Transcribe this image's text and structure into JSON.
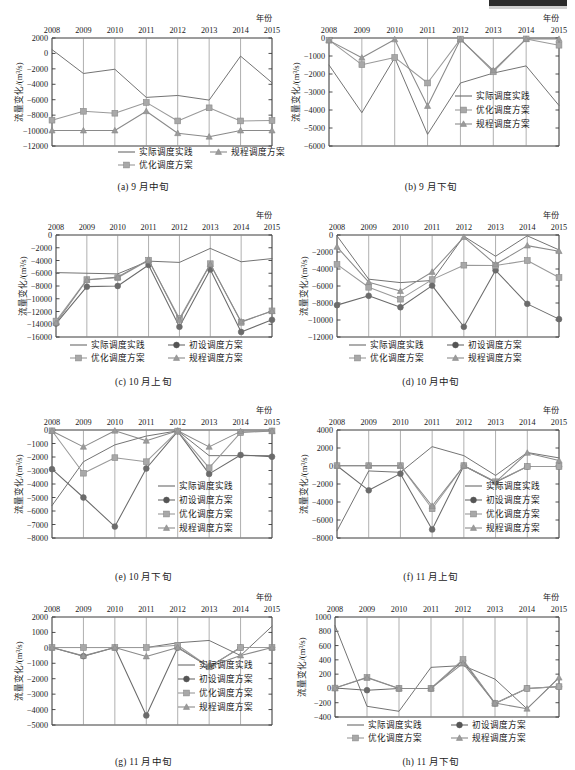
{
  "figure": {
    "year_axis_label": "年份",
    "y_axis_label": "流量变化/(m³/s)",
    "years": [
      "2008",
      "2009",
      "2010",
      "2011",
      "2012",
      "2013",
      "2014",
      "2015"
    ],
    "series_labels": {
      "actual": "实际调度实践",
      "initial": "初设调度方案",
      "optimized": "优化调度方案",
      "regulation": "规程调度方案"
    },
    "colors": {
      "actual": "#6b6b6b",
      "initial": "#555555",
      "optimized": "#9a9a9a",
      "regulation": "#8a8a8a",
      "axis": "#3a3a3a",
      "grid": "#8c8c8c"
    }
  },
  "chart_data": [
    {
      "id": "a",
      "type": "line",
      "title": "(a) 9 月中旬",
      "xlabel": "年份",
      "ylabel": "流量变化/(m³/s)",
      "categories": [
        "2008",
        "2009",
        "2010",
        "2011",
        "2012",
        "2013",
        "2014",
        "2015"
      ],
      "ylim": [
        -12000,
        2000
      ],
      "yticks": [
        2000,
        0,
        -2000,
        -4000,
        -6000,
        -8000,
        -10000,
        -12000
      ],
      "grid": true,
      "legend_position": "inside-bottom",
      "series": [
        {
          "name": "实际调度实践",
          "key": "actual",
          "marker": "none",
          "values": [
            500,
            -2600,
            -2050,
            -5700,
            -5450,
            -6050,
            -350,
            -3800
          ]
        },
        {
          "name": "优化调度方案",
          "key": "optimized",
          "marker": "square",
          "values": [
            -8650,
            -7500,
            -7750,
            -6350,
            -8750,
            -7050,
            -8750,
            -8700
          ]
        },
        {
          "name": "规程调度方案",
          "key": "regulation",
          "marker": "triangle",
          "values": [
            -10000,
            -10000,
            -10000,
            -7500,
            -10350,
            -10800,
            -10000,
            -10000
          ]
        }
      ]
    },
    {
      "id": "b",
      "type": "line",
      "title": "(b) 9 月下旬",
      "xlabel": "年份",
      "ylabel": "流量变化/(m³/s)",
      "categories": [
        "2008",
        "2009",
        "2010",
        "2011",
        "2012",
        "2013",
        "2014",
        "2015"
      ],
      "ylim": [
        -6000,
        0
      ],
      "yticks": [
        0,
        -1000,
        -2000,
        -3000,
        -4000,
        -5000,
        -6000
      ],
      "grid": true,
      "legend_position": "inside-right",
      "series": [
        {
          "name": "实际调度实践",
          "key": "actual",
          "marker": "none",
          "values": [
            -1500,
            -4150,
            -1100,
            -5350,
            -2500,
            -1950,
            -1550,
            -3750
          ]
        },
        {
          "name": "优化调度方案",
          "key": "optimized",
          "marker": "square",
          "values": [
            -120,
            -1480,
            -1080,
            -2500,
            -60,
            -1880,
            -50,
            -400
          ]
        },
        {
          "name": "规程调度方案",
          "key": "regulation",
          "marker": "triangle",
          "values": [
            -130,
            -1100,
            -80,
            -3780,
            -80,
            -1800,
            -60,
            -60
          ]
        }
      ]
    },
    {
      "id": "c",
      "type": "line",
      "title": "(c) 10 月上旬",
      "xlabel": "年份",
      "ylabel": "流量变化/(m³/s)",
      "categories": [
        "2008",
        "2009",
        "2010",
        "2011",
        "2012",
        "2013",
        "2014",
        "2015"
      ],
      "ylim": [
        -16000,
        0
      ],
      "yticks": [
        0,
        -2000,
        -4000,
        -6000,
        -8000,
        -10000,
        -12000,
        -14000,
        -16000
      ],
      "grid": true,
      "legend_position": "below-inside",
      "series": [
        {
          "name": "实际调度实践",
          "key": "actual",
          "marker": "none",
          "values": [
            -5900,
            -6000,
            -6100,
            -4100,
            -4300,
            -2100,
            -4200,
            -3700
          ]
        },
        {
          "name": "初设调度方案",
          "key": "initial",
          "marker": "circle",
          "values": [
            -13900,
            -8100,
            -8000,
            -4700,
            -14400,
            -5400,
            -15200,
            -13300
          ]
        },
        {
          "name": "优化调度方案",
          "key": "optimized",
          "marker": "square",
          "values": [
            -13500,
            -7000,
            -6700,
            -3950,
            -13100,
            -4500,
            -13700,
            -11900
          ]
        },
        {
          "name": "规程调度方案",
          "key": "regulation",
          "marker": "triangle",
          "values": [
            -13800,
            -7050,
            -6600,
            -3900,
            -13350,
            -4600,
            -13600,
            -11950
          ]
        }
      ]
    },
    {
      "id": "d",
      "type": "line",
      "title": "(d) 10 月中旬",
      "xlabel": "年份",
      "ylabel": "流量变化/(m³/s)",
      "categories": [
        "2008",
        "2009",
        "2010",
        "2011",
        "2012",
        "2013",
        "2014",
        "2015"
      ],
      "ylim": [
        -12000,
        0
      ],
      "yticks": [
        0,
        -2000,
        -4000,
        -6000,
        -8000,
        -10000,
        -12000
      ],
      "grid": true,
      "legend_position": "below-inside",
      "series": [
        {
          "name": "实际调度实践",
          "key": "actual",
          "marker": "none",
          "values": [
            -100,
            -5200,
            -5600,
            -5350,
            -150,
            -2500,
            -100,
            -1750
          ]
        },
        {
          "name": "初设调度方案",
          "key": "initial",
          "marker": "circle",
          "values": [
            -8250,
            -7150,
            -8500,
            -5950,
            -10800,
            -4150,
            -8100,
            -9900
          ]
        },
        {
          "name": "优化调度方案",
          "key": "optimized",
          "marker": "square",
          "values": [
            -3450,
            -6150,
            -7550,
            -5250,
            -3550,
            -3600,
            -3000,
            -5000
          ]
        },
        {
          "name": "规程调度方案",
          "key": "regulation",
          "marker": "triangle",
          "values": [
            -1400,
            -5550,
            -6600,
            -4350,
            -250,
            -3450,
            -1250,
            -1900
          ]
        }
      ]
    },
    {
      "id": "e",
      "type": "line",
      "title": "(e) 10 月下旬",
      "xlabel": "年份",
      "ylabel": "流量变化/(m³/s)",
      "categories": [
        "2008",
        "2009",
        "2010",
        "2011",
        "2012",
        "2013",
        "2014",
        "2015"
      ],
      "ylim": [
        -8000,
        0
      ],
      "yticks": [
        0,
        -1000,
        -2000,
        -3000,
        -4000,
        -5000,
        -6000,
        -7000,
        -8000
      ],
      "grid": true,
      "legend_position": "inside-right",
      "series": [
        {
          "name": "实际调度实践",
          "key": "actual",
          "marker": "none",
          "values": [
            -5600,
            -2350,
            -1100,
            -450,
            -60,
            -1900,
            -1900,
            -1900
          ]
        },
        {
          "name": "初设调度方案",
          "key": "initial",
          "marker": "circle",
          "values": [
            -2900,
            -5000,
            -7150,
            -2850,
            -100,
            -3250,
            -1850,
            -1980
          ]
        },
        {
          "name": "优化调度方案",
          "key": "optimized",
          "marker": "square",
          "values": [
            -60,
            -3200,
            -2050,
            -2350,
            -80,
            -2800,
            -200,
            -70
          ]
        },
        {
          "name": "规程调度方案",
          "key": "regulation",
          "marker": "triangle",
          "values": [
            -70,
            -1250,
            -60,
            -800,
            -60,
            -1250,
            -100,
            -70
          ]
        }
      ]
    },
    {
      "id": "f",
      "type": "line",
      "title": "(f) 11 月上旬",
      "xlabel": "年份",
      "ylabel": "流量变化/(m³/s)",
      "categories": [
        "2008",
        "2009",
        "2010",
        "2011",
        "2012",
        "2013",
        "2014",
        "2015"
      ],
      "ylim": [
        -8000,
        4000
      ],
      "yticks": [
        4000,
        2000,
        0,
        -2000,
        -4000,
        -6000,
        -8000
      ],
      "grid": true,
      "legend_position": "inside-right",
      "series": [
        {
          "name": "实际调度实践",
          "key": "actual",
          "marker": "none",
          "values": [
            -7200,
            -550,
            -700,
            2150,
            1150,
            -1050,
            1500,
            900
          ]
        },
        {
          "name": "初设调度方案",
          "key": "initial",
          "marker": "circle",
          "values": [
            30,
            -2700,
            -850,
            -7050,
            30,
            -1800,
            -60,
            -60
          ]
        },
        {
          "name": "优化调度方案",
          "key": "optimized",
          "marker": "square",
          "values": [
            40,
            40,
            40,
            -4750,
            40,
            -1750,
            -50,
            -50
          ]
        },
        {
          "name": "规程调度方案",
          "key": "regulation",
          "marker": "triangle",
          "values": [
            30,
            30,
            30,
            -4450,
            30,
            -1800,
            1450,
            600
          ]
        }
      ]
    },
    {
      "id": "g",
      "type": "line",
      "title": "(g) 11 月中旬",
      "xlabel": "年份",
      "ylabel": "流量变化/(m³/s)",
      "categories": [
        "2008",
        "2009",
        "2010",
        "2011",
        "2012",
        "2013",
        "2014",
        "2015"
      ],
      "ylim": [
        -5000,
        2000
      ],
      "yticks": [
        2000,
        1000,
        0,
        -1000,
        -2000,
        -3000,
        -4000,
        -5000
      ],
      "grid": true,
      "legend_position": "inside-right",
      "series": [
        {
          "name": "实际调度实践",
          "key": "actual",
          "marker": "none",
          "values": [
            20,
            20,
            20,
            20,
            330,
            480,
            -500,
            1400
          ]
        },
        {
          "name": "初设调度方案",
          "key": "initial",
          "marker": "circle",
          "values": [
            20,
            -540,
            20,
            -4380,
            20,
            -1230,
            20,
            20
          ]
        },
        {
          "name": "优化调度方案",
          "key": "optimized",
          "marker": "square",
          "values": [
            20,
            20,
            20,
            20,
            170,
            -1230,
            20,
            20
          ]
        },
        {
          "name": "规程调度方案",
          "key": "regulation",
          "marker": "triangle",
          "values": [
            20,
            -520,
            20,
            -560,
            20,
            -1230,
            -500,
            20
          ]
        }
      ]
    },
    {
      "id": "h",
      "type": "line",
      "title": "(h) 11 月下旬",
      "xlabel": "年份",
      "ylabel": "流量变化/(m³/s)",
      "categories": [
        "2008",
        "2009",
        "2010",
        "2011",
        "2012",
        "2013",
        "2014",
        "2015"
      ],
      "ylim": [
        -400,
        1000
      ],
      "yticks": [
        1000,
        800,
        600,
        400,
        200,
        0,
        -200,
        -400
      ],
      "grid": true,
      "legend_position": "below-inside",
      "series": [
        {
          "name": "实际调度实践",
          "key": "actual",
          "marker": "none",
          "values": [
            880,
            -250,
            -320,
            295,
            320,
            130,
            -285,
            150
          ]
        },
        {
          "name": "初设调度方案",
          "key": "initial",
          "marker": "circle",
          "values": [
            5,
            -25,
            0,
            0,
            390,
            -210,
            0,
            25
          ]
        },
        {
          "name": "优化调度方案",
          "key": "optimized",
          "marker": "square",
          "values": [
            5,
            155,
            0,
            0,
            405,
            -210,
            0,
            25
          ]
        },
        {
          "name": "规程调度方案",
          "key": "regulation",
          "marker": "triangle",
          "values": [
            5,
            150,
            0,
            0,
            350,
            -205,
            -285,
            150
          ]
        }
      ]
    }
  ]
}
